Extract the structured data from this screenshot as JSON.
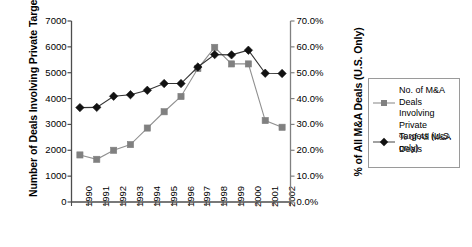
{
  "chart_data": {
    "type": "line",
    "title": "",
    "xlabel": "",
    "categories": [
      "1990",
      "1991",
      "1992",
      "1993",
      "1994",
      "1995",
      "1996",
      "1997",
      "1998",
      "1999",
      "2000",
      "2001",
      "2002"
    ],
    "grid": false,
    "legend_position": "right",
    "axes": {
      "left": {
        "label": "Number of Deals Involving Private Targets (U.S. Only)",
        "ylim": [
          0,
          7000
        ],
        "tick_step": 1000,
        "ticks": [
          0,
          1000,
          2000,
          3000,
          4000,
          5000,
          6000,
          7000
        ],
        "tick_labels": [
          "0",
          "1000",
          "2000",
          "3000",
          "4000",
          "5000",
          "6000",
          "7000"
        ]
      },
      "right": {
        "label": "% of All M&A Deals (U.S. Only)",
        "ylim": [
          0,
          70
        ],
        "tick_step": 10,
        "ticks": [
          0,
          10,
          20,
          30,
          40,
          50,
          60,
          70
        ],
        "tick_labels": [
          "0.0%",
          "10.0%",
          "20.0%",
          "30.0%",
          "40.0%",
          "50.0%",
          "60.0%",
          "70.0%"
        ]
      }
    },
    "series": [
      {
        "name": "No. of M&A Deals Involving Private Targets (U.S. only)",
        "axis": "left",
        "marker": "square",
        "color": "#808080",
        "line_color": "#909090",
        "values": [
          1820,
          1650,
          2000,
          2220,
          2860,
          3490,
          4080,
          5160,
          5980,
          5340,
          5340,
          3150,
          2890
        ]
      },
      {
        "name": "% of All M&A Deals",
        "axis": "right",
        "marker": "diamond",
        "color": "#111111",
        "line_color": "#333333",
        "values": [
          36.5,
          36.6,
          40.9,
          41.5,
          43.2,
          45.8,
          45.8,
          52.2,
          57.0,
          56.9,
          58.7,
          49.8,
          49.7
        ]
      }
    ]
  },
  "legend": {
    "entries": [
      {
        "label": "No. of M&A Deals Involving Private Targets (U.S. only)",
        "marker": "square",
        "color": "#808080"
      },
      {
        "label": "% of All M&A Deals",
        "marker": "diamond",
        "color": "#111111"
      }
    ]
  }
}
